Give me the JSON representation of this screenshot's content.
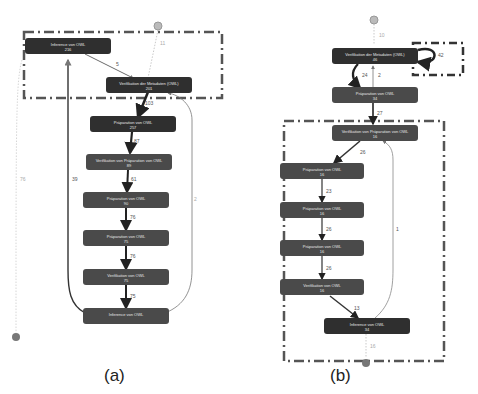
{
  "panels": [
    {
      "id": "a",
      "caption": "(a)",
      "nodes": [
        {
          "label": "Inference von OWL",
          "count": "216"
        },
        {
          "label": "Verifikation der Metadaten (OWL)",
          "count": "201"
        },
        {
          "label": "Präparation von OWL",
          "count": "257"
        },
        {
          "label": "Verifikation von Präparation von OWL",
          "count": "89"
        },
        {
          "label": "Präparation von OWL",
          "count": "90"
        },
        {
          "label": "Präparation von OWL",
          "count": "75"
        },
        {
          "label": "Verifikation von OWL",
          "count": "75"
        },
        {
          "label": "Inference von OWL",
          "count": ""
        }
      ],
      "edge_labels": {
        "start_to_n2": "11",
        "n1_to_n2": "5",
        "n2_to_n3": "103",
        "n3_to_n4": "87",
        "n4_to_n5": "61",
        "n5_to_n6": "76",
        "n6_to_n7": "76",
        "n7_to_n8": "75",
        "n8_to_n1": "39",
        "n8_to_n2": "2",
        "start_to_end": "76"
      }
    },
    {
      "id": "b",
      "caption": "(b)",
      "nodes": [
        {
          "label": "Verifikation der Metadaten (OWL)",
          "count": "46"
        },
        {
          "label": "Präparation von OWL",
          "count": "34"
        },
        {
          "label": "Verifikation von Präparation von OWL",
          "count": "16"
        },
        {
          "label": "Präparation von OWL",
          "count": "16"
        },
        {
          "label": "Präparation von OWL",
          "count": "16"
        },
        {
          "label": "Präparation von OWL",
          "count": "16"
        },
        {
          "label": "Verifikation von OWL",
          "count": "16"
        },
        {
          "label": "Inference von OWL",
          "count": "34"
        }
      ],
      "edge_labels": {
        "start_to_n1": "10",
        "self_loop": "42",
        "n1_to_n2": "24",
        "n2_to_n1": "2",
        "n2_to_n3": "27",
        "n3_to_n4": "26",
        "n4_to_n5": "23",
        "n5_to_n6": "26",
        "n6_to_n7": "26",
        "n7_to_n8": "13",
        "n8_to_n3": "1",
        "n8_to_end": "16"
      }
    }
  ],
  "colors": {
    "node_dark": "#2f2f2f",
    "node_mid": "#4a4a4a",
    "edge": "#333333",
    "highlight_border": "#555555",
    "start_end_marker": "#999999"
  }
}
